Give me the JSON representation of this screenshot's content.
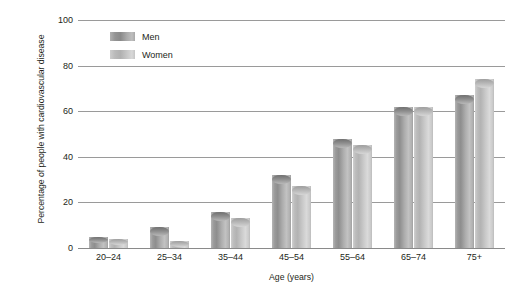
{
  "chart_data": {
    "type": "bar",
    "title": "",
    "xlabel": "Age (years)",
    "ylabel": "Percentage of people with cardiovascular disease",
    "categories": [
      "20–24",
      "25–34",
      "35–44",
      "45–54",
      "55–64",
      "65–74",
      "75+"
    ],
    "series": [
      {
        "name": "Men",
        "values": [
          5,
          9,
          16,
          32,
          48,
          62,
          67
        ]
      },
      {
        "name": "Women",
        "values": [
          4,
          3,
          13,
          27,
          45,
          62,
          74
        ]
      }
    ],
    "ylim": [
      0,
      100
    ],
    "yticks": [
      0,
      20,
      40,
      60,
      80,
      100
    ],
    "ytick_labels": [
      "0",
      "20",
      "40",
      "60",
      "80",
      "100"
    ],
    "grid": true,
    "legend_position": "top-left",
    "colors": {
      "men": "#9a9a9a",
      "women": "#c4c4c4",
      "gridline": "#9a9a9a",
      "text": "#231f20",
      "background": "#ffffff"
    }
  }
}
